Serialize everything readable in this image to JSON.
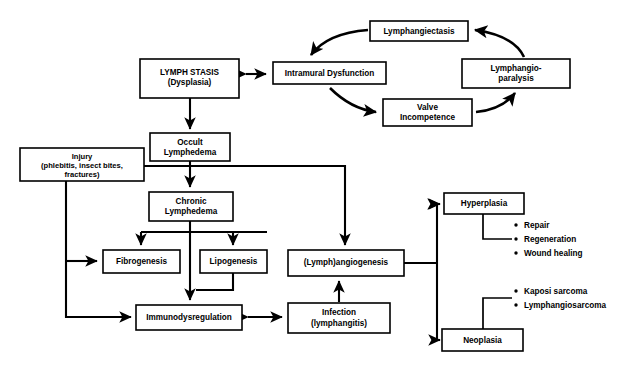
{
  "diagram": {
    "background_color": "#ffffff",
    "line_color": "#000000",
    "nodes": {
      "lymphangiectasis": {
        "label": "Lymphangiectasis"
      },
      "intramural_dysfunction": {
        "label": "Intramural Dysfunction"
      },
      "lymphangio_paralysis": {
        "line1": "Lymphangio-",
        "line2": "paralysis"
      },
      "valve_incompetence": {
        "line1": "Valve",
        "line2": "Incompetence"
      },
      "lymph_stasis": {
        "line1": "LYMPH STASIS",
        "line2": "(Dysplasia)"
      },
      "occult_lymphedema": {
        "line1": "Occult",
        "line2": "Lymphedema"
      },
      "injury": {
        "line1": "Injury",
        "line2": "(phlebitis, insect bites,",
        "line3": "fractures)"
      },
      "chronic_lymphedema": {
        "line1": "Chronic",
        "line2": "Lymphedema"
      },
      "fibrogenesis": {
        "label": "Fibrogenesis"
      },
      "lipogenesis": {
        "label": "Lipogenesis"
      },
      "angiogenesis": {
        "label": "(Lymph)angiogenesis"
      },
      "immunodysregulation": {
        "label": "Immunodysregulation"
      },
      "infection": {
        "line1": "Infection",
        "line2": "(lymphangitis)"
      },
      "hyperplasia": {
        "label": "Hyperplasia"
      },
      "neoplasia": {
        "label": "Neoplasia"
      }
    },
    "annotations": {
      "hyperplasia_outcomes": [
        "Repair",
        "Regeneration",
        "Wound healing"
      ],
      "neoplasia_outcomes": [
        "Kaposi sarcoma",
        "Lymphangiosarcoma"
      ]
    }
  }
}
